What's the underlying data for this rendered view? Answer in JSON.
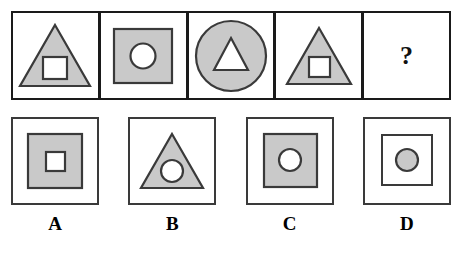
{
  "puzzle": {
    "type": "visual-analogy-matrix",
    "colors": {
      "fill_gray": "#c9c9c9",
      "fill_white": "#ffffff",
      "stroke": "#3a3a3a",
      "frame": "#1a1a1a",
      "text": "#000000"
    },
    "problem_row": {
      "cells": [
        {
          "id": "cell-1",
          "outer_shape": "triangle",
          "outer_fill": "gray",
          "inner_shape": "square",
          "inner_fill": "white"
        },
        {
          "id": "cell-2",
          "outer_shape": "square",
          "outer_fill": "gray",
          "inner_shape": "circle",
          "inner_fill": "white"
        },
        {
          "id": "cell-3",
          "outer_shape": "circle",
          "outer_fill": "gray",
          "inner_shape": "triangle",
          "inner_fill": "white"
        },
        {
          "id": "cell-4",
          "outer_shape": "triangle",
          "outer_fill": "gray",
          "inner_shape": "square",
          "inner_fill": "white"
        },
        {
          "id": "cell-5",
          "outer_shape": "none",
          "content": "question-mark",
          "question_mark": "?"
        }
      ]
    },
    "options": [
      {
        "id": "option-a",
        "label": "A",
        "outer_shape": "square",
        "outer_fill": "gray",
        "inner_shape": "square",
        "inner_fill": "white"
      },
      {
        "id": "option-b",
        "label": "B",
        "outer_shape": "triangle",
        "outer_fill": "gray",
        "inner_shape": "circle",
        "inner_fill": "white"
      },
      {
        "id": "option-c",
        "label": "C",
        "outer_shape": "square",
        "outer_fill": "gray",
        "inner_shape": "circle",
        "inner_fill": "white"
      },
      {
        "id": "option-d",
        "label": "D",
        "outer_shape": "square",
        "outer_fill": "white",
        "inner_shape": "circle",
        "inner_fill": "gray"
      }
    ]
  }
}
